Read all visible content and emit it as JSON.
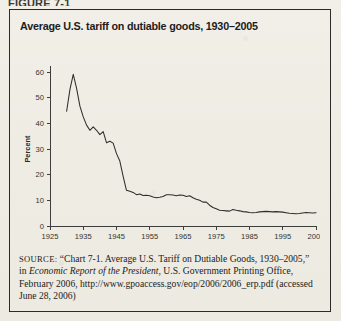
{
  "figure": {
    "label": "FIGURE 7-1",
    "title": "Average U.S. tariff on dutiable goods, 1930–2005"
  },
  "source": {
    "label": "SOURCE:",
    "part1": " “Chart 7-1. Average U.S. Tariff on Dutiable Goods, 1930–2005,” in ",
    "italic": "Economic Report of the President",
    "part2": ", U.S. Government Printing Office, February 2006, http://www.gpoaccess.gov/eop/2006/2006_erp.pdf (accessed June 28, 2006)"
  },
  "chart_data": {
    "type": "line",
    "title": "Average U.S. tariff on dutiable goods, 1930–2005",
    "xlabel": "",
    "ylabel": "Percent",
    "xlim": [
      1925,
      2005
    ],
    "ylim": [
      0,
      60
    ],
    "xticks": [
      1925,
      1935,
      1945,
      1955,
      1965,
      1975,
      1985,
      1995,
      2005
    ],
    "yticks": [
      0,
      10,
      20,
      30,
      40,
      50,
      60
    ],
    "grid": false,
    "legend": false,
    "series": [
      {
        "name": "Average U.S. tariff on dutiable goods",
        "x": [
          1930,
          1931,
          1932,
          1933,
          1934,
          1935,
          1936,
          1937,
          1938,
          1939,
          1940,
          1941,
          1942,
          1943,
          1944,
          1945,
          1946,
          1947,
          1948,
          1949,
          1950,
          1951,
          1952,
          1953,
          1954,
          1955,
          1956,
          1957,
          1958,
          1959,
          1960,
          1961,
          1962,
          1963,
          1964,
          1965,
          1966,
          1967,
          1968,
          1969,
          1970,
          1971,
          1972,
          1973,
          1974,
          1975,
          1976,
          1977,
          1978,
          1979,
          1980,
          1981,
          1982,
          1983,
          1984,
          1985,
          1986,
          1987,
          1988,
          1989,
          1990,
          1991,
          1992,
          1993,
          1994,
          1995,
          1996,
          1997,
          1998,
          1999,
          2000,
          2001,
          2002,
          2003,
          2004,
          2005
        ],
        "y": [
          44.7,
          53.2,
          59.1,
          53.6,
          46.7,
          42.5,
          39.3,
          37.3,
          38.6,
          37.3,
          35.6,
          36.8,
          32.4,
          33.0,
          32.3,
          28.2,
          25.3,
          19.3,
          13.9,
          13.5,
          13.1,
          12.2,
          12.5,
          11.9,
          12.0,
          11.8,
          11.3,
          11.0,
          11.2,
          11.5,
          12.2,
          12.2,
          12.1,
          11.8,
          12.1,
          12.0,
          11.5,
          11.8,
          11.0,
          10.4,
          10.0,
          9.3,
          9.3,
          8.1,
          7.2,
          6.7,
          6.1,
          6.0,
          5.9,
          5.8,
          6.4,
          6.1,
          5.9,
          5.6,
          5.5,
          5.3,
          5.2,
          5.3,
          5.5,
          5.6,
          5.7,
          5.6,
          5.5,
          5.6,
          5.5,
          5.4,
          5.2,
          5.0,
          4.9,
          4.8,
          4.9,
          5.1,
          5.3,
          5.2,
          5.1,
          5.2
        ]
      }
    ]
  }
}
